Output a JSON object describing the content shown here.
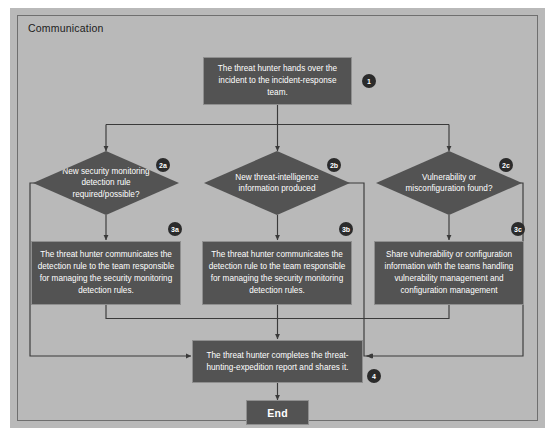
{
  "lane": {
    "title": "Communication"
  },
  "colors": {
    "lane_background": "#b9b9b9",
    "node_fill": "#535353",
    "node_text": "#ffffff",
    "connector": "#3a3a3a",
    "badge_fill": "#2b2b2b",
    "page_background": "#ffffff"
  },
  "nodes": {
    "step1": {
      "id": "1",
      "type": "process",
      "text": "The threat hunter hands over the incident to the incident-response team."
    },
    "decision_2a": {
      "id": "2a",
      "type": "decision",
      "text": "New security monitoring detection rule required/possible?"
    },
    "decision_2b": {
      "id": "2b",
      "type": "decision",
      "text": "New threat-intelligence information produced"
    },
    "decision_2c": {
      "id": "2c",
      "type": "decision",
      "text": "Vulnerability or misconfiguration found?"
    },
    "step3a": {
      "id": "3a",
      "type": "process",
      "text": "The threat hunter communicates the detection rule to the team responsible for managing the security monitoring detection rules."
    },
    "step3b": {
      "id": "3b",
      "type": "process",
      "text": "The threat hunter communicates the detection rule to the team responsible for managing the security monitoring detection rules."
    },
    "step3c": {
      "id": "3c",
      "type": "process",
      "text": "Share vulnerability or configuration information with the teams handling vulnerability management and configuration management"
    },
    "step4": {
      "id": "4",
      "type": "process",
      "text": "The threat hunter completes the threat-hunting-expedition report and shares it."
    },
    "end": {
      "type": "terminal",
      "text": "End"
    }
  }
}
